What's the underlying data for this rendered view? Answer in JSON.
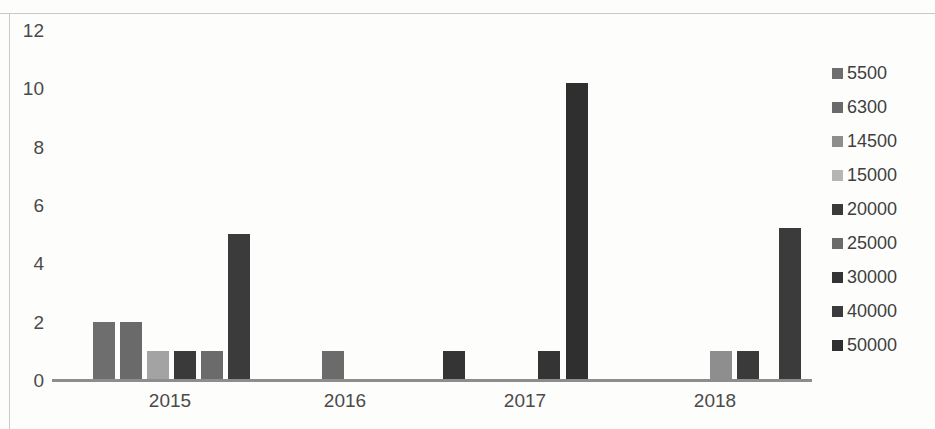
{
  "chart_data": {
    "type": "bar",
    "title": "",
    "xlabel": "",
    "ylabel": "",
    "categories": [
      "2015",
      "2016",
      "2017",
      "2018"
    ],
    "ylim": [
      0,
      12
    ],
    "yticks": [
      0,
      2,
      4,
      6,
      8,
      10,
      12
    ],
    "grid": false,
    "legend_position": "right",
    "series": [
      {
        "name": "5500",
        "color": "#6e6e6e",
        "values": [
          2,
          0,
          0,
          0
        ]
      },
      {
        "name": "6300",
        "color": "#6a6a6a",
        "values": [
          2,
          0,
          0,
          0
        ]
      },
      {
        "name": "14500",
        "color": "#a3a3a3",
        "values": [
          1,
          0,
          0,
          1
        ]
      },
      {
        "name": "15000",
        "color": "#b5b5b5",
        "values": [
          0,
          0,
          0,
          0
        ]
      },
      {
        "name": "20000",
        "color": "#3a3a3a",
        "values": [
          1,
          0,
          0,
          1
        ]
      },
      {
        "name": "25000",
        "color": "#6b6b6b",
        "values": [
          1,
          1,
          0,
          0
        ]
      },
      {
        "name": "30000",
        "color": "#343434",
        "values": [
          0,
          1,
          1,
          0
        ]
      },
      {
        "name": "40000",
        "color": "#3b3b3b",
        "values": [
          5,
          0,
          0,
          5.2
        ]
      },
      {
        "name": "50000",
        "color": "#2f2f2f",
        "values": [
          0,
          0,
          10.2,
          0
        ]
      }
    ],
    "bars": [
      {
        "group": "2015",
        "series": "5500",
        "value": 2,
        "x": 93,
        "width": 22,
        "color": "#6e6e6e"
      },
      {
        "group": "2015",
        "series": "6300",
        "value": 2,
        "x": 120,
        "width": 22,
        "color": "#6a6a6a"
      },
      {
        "group": "2015",
        "series": "14500",
        "value": 1,
        "x": 147,
        "width": 22,
        "color": "#a3a3a3"
      },
      {
        "group": "2015",
        "series": "20000",
        "value": 1,
        "x": 174,
        "width": 22,
        "color": "#3a3a3a"
      },
      {
        "group": "2015",
        "series": "25000",
        "value": 1,
        "x": 201,
        "width": 22,
        "color": "#6b6b6b"
      },
      {
        "group": "2015",
        "series": "40000",
        "value": 5,
        "x": 228,
        "width": 22,
        "color": "#3b3b3b"
      },
      {
        "group": "2016",
        "series": "25000",
        "value": 1,
        "x": 322,
        "width": 22,
        "color": "#6b6b6b"
      },
      {
        "group": "2016",
        "series": "30000",
        "value": 1,
        "x": 443,
        "width": 22,
        "color": "#343434"
      },
      {
        "group": "2017",
        "series": "30000",
        "value": 1,
        "x": 538,
        "width": 22,
        "color": "#343434"
      },
      {
        "group": "2017",
        "series": "50000",
        "value": 10.2,
        "x": 566,
        "width": 22,
        "color": "#2f2f2f"
      },
      {
        "group": "2018",
        "series": "14500",
        "value": 1,
        "x": 710,
        "width": 22,
        "color": "#8e8e8e"
      },
      {
        "group": "2018",
        "series": "20000",
        "value": 1,
        "x": 737,
        "width": 22,
        "color": "#3a3a3a"
      },
      {
        "group": "2018",
        "series": "40000",
        "value": 5.2,
        "x": 779,
        "width": 22,
        "color": "#3b3b3b"
      }
    ],
    "group_label_x": [
      170,
      345,
      525,
      715
    ]
  },
  "legend": {
    "items": [
      {
        "label": "5500",
        "color": "#6e6e6e"
      },
      {
        "label": "6300",
        "color": "#6a6a6a"
      },
      {
        "label": "14500",
        "color": "#8e8e8e"
      },
      {
        "label": "15000",
        "color": "#b5b5b5"
      },
      {
        "label": "20000",
        "color": "#3a3a3a"
      },
      {
        "label": "25000",
        "color": "#6b6b6b"
      },
      {
        "label": "30000",
        "color": "#343434"
      },
      {
        "label": "40000",
        "color": "#3b3b3b"
      },
      {
        "label": "50000",
        "color": "#2f2f2f"
      }
    ]
  }
}
